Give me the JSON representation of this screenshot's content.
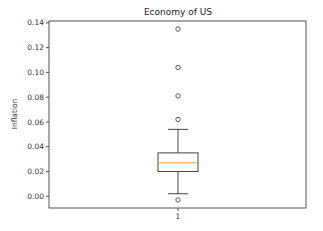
{
  "chart_data": {
    "type": "box",
    "title": "Economy of US",
    "xlabel": "",
    "ylabel": "Inflation",
    "categories": [
      "1"
    ],
    "ylim": [
      -0.0095,
      0.1415
    ],
    "yticks": [
      0.0,
      0.02,
      0.04,
      0.06,
      0.08,
      0.1,
      0.12,
      0.14
    ],
    "ytick_labels": [
      "0.00",
      "0.02",
      "0.04",
      "0.06",
      "0.08",
      "0.10",
      "0.12",
      "0.14"
    ],
    "grid": false,
    "series": [
      {
        "name": "1",
        "whisker_low": 0.002,
        "q1": 0.02,
        "median": 0.027,
        "q3": 0.035,
        "whisker_high": 0.054,
        "outliers": [
          -0.003,
          0.062,
          0.081,
          0.104,
          0.135
        ]
      }
    ]
  },
  "colors": {
    "axes": "#555555",
    "box": "#444444",
    "median": "#f0a030",
    "background": "#ffffff"
  }
}
